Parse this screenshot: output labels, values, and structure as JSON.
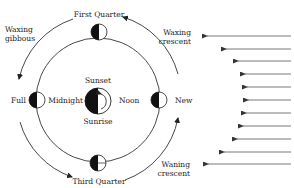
{
  "diagram": {
    "earth": {
      "labels": {
        "top": "Sunset",
        "bottom": "Sunrise",
        "left": "Midnight",
        "right": "Noon"
      }
    },
    "moon_positions": [
      {
        "name": "First Quarter",
        "position": "top"
      },
      {
        "name": "Full",
        "position": "left"
      },
      {
        "name": "New",
        "position": "right"
      },
      {
        "name": "Third Quarter",
        "position": "bottom"
      }
    ],
    "intermediate_phases": [
      {
        "name_line1": "Waxing",
        "name_line2": "gibbous",
        "position": "upper-left"
      },
      {
        "name_line1": "Waxing",
        "name_line2": "crescent",
        "position": "upper-right"
      },
      {
        "name_line1": "Waning",
        "name_line2": "crescent",
        "position": "lower-right"
      }
    ],
    "sunlight": {
      "arrow_count": 11,
      "direction": "left"
    },
    "colors": {
      "ink": "#222222",
      "rays": "#555555",
      "background": "#ffffff"
    }
  }
}
